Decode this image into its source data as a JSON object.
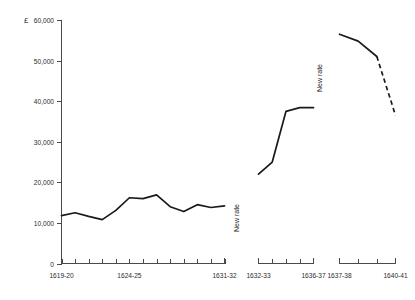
{
  "chart_data": {
    "type": "line",
    "title": "",
    "xlabel": "",
    "ylabel": "£",
    "currency_symbol": "£",
    "ylim": [
      0,
      60000
    ],
    "ytick_values": [
      0,
      10000,
      20000,
      30000,
      40000,
      50000,
      60000
    ],
    "ytick_labels": [
      "0",
      "10,000",
      "20,000",
      "30,000",
      "40,000",
      "50,000",
      "60,000"
    ],
    "grid": false,
    "legend": "none",
    "annotations": [
      {
        "text": "New rate",
        "orientation": "vertical",
        "near_segment": 2
      },
      {
        "text": "New rate",
        "orientation": "vertical",
        "near_segment": 3
      }
    ],
    "segments": [
      {
        "name": "Old rate 1619-20 to 1631-32",
        "style": "solid",
        "axis_label_start": "1619-20",
        "axis_label_mid": "1624-25",
        "axis_label_end": "1631-32",
        "categories": [
          "1619-20",
          "1620-21",
          "1621-22",
          "1622-23",
          "1623-24",
          "1624-25",
          "1625-26",
          "1626-27",
          "1627-28",
          "1628-29",
          "1629-30",
          "1630-31",
          "1631-32"
        ],
        "values": [
          11800,
          12500,
          11600,
          10800,
          13100,
          16200,
          16000,
          16900,
          14000,
          12800,
          14500,
          13800,
          14200
        ]
      },
      {
        "name": "New rate 1632-33 to 1636-37",
        "style": "solid",
        "axis_label_start": "1632-33",
        "axis_label_end": "1636-37",
        "categories": [
          "1632-33",
          "1633-34",
          "1634-35",
          "1635-36",
          "1636-37"
        ],
        "values": [
          22000,
          25000,
          37500,
          38400,
          38400
        ]
      },
      {
        "name": "New rate 1637-38 to 1640-41",
        "style": "solid-then-dashed",
        "axis_label_start": "1637-38",
        "axis_label_end": "1640-41",
        "categories": [
          "1637-38",
          "1638-39",
          "1639-40",
          "1640-41"
        ],
        "values": [
          56500,
          54800,
          51000,
          36500
        ],
        "dashed_from_index": 2
      }
    ],
    "xtick_labels_visible": [
      "1619-20",
      "1624-25",
      "1631-32",
      "1632-33",
      "1636-37",
      "1637-38",
      "1640-41"
    ]
  },
  "colors": {
    "line": "#1a1a1a",
    "axis": "#4a4a4a",
    "background": "#ffffff",
    "text": "#2b2b2b"
  }
}
